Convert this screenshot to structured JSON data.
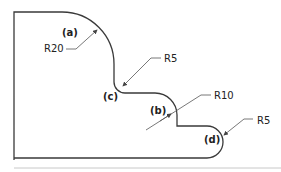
{
  "diagram": {
    "colors": {
      "line": "#3a3a3a",
      "leader": "#555555",
      "divider": "#bdbdbd",
      "text": "#222222"
    },
    "features": [
      {
        "id": "a",
        "label": "(a)",
        "radius_label": "R20"
      },
      {
        "id": "c",
        "label": "(c)",
        "radius_label": "R5"
      },
      {
        "id": "b",
        "label": "(b)",
        "radius_label": "R10"
      },
      {
        "id": "d",
        "label": "(d)",
        "radius_label": "R5"
      }
    ]
  }
}
